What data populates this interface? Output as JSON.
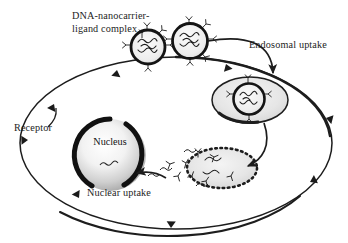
{
  "figure": {
    "background_color": "#ffffff",
    "ink_color": "#1d1d1d"
  },
  "labels": {
    "complex_line1": "DNA-nanocarrier-",
    "complex_line2": "ligand complex",
    "endosomal_uptake": "Endosomal uptake",
    "receptor": "Receptor",
    "nucleus": "Nucleus",
    "nuclear_uptake": "Nuclear uptake"
  },
  "structures": {
    "cell_membrane": "cell-membrane-ellipse",
    "nucleus": "nucleus-sphere",
    "endosome": "endosome-vesicle",
    "disrupted_endosome": "disrupted-endosome-dotted-vesicle",
    "nanocarriers": [
      "nanocarrier-1",
      "nanocarrier-2",
      "nanocarrier-in-endosome"
    ],
    "receptor_count": 7,
    "ligand_symbol": "Y"
  },
  "colors": {
    "outline": "#1d1d1d",
    "nucleus_core": "#ffffff",
    "nucleus_edge": "#9a9a9a",
    "vesicle_fill": "#e4e4e4",
    "carrier_ring": "#141414"
  }
}
